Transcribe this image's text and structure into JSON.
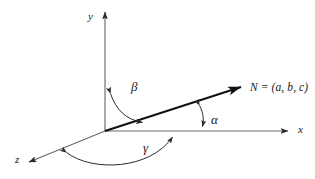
{
  "figure": {
    "background_color": "#ffffff",
    "axis_color": "#6b6b6b",
    "vector_color": "#111111",
    "arc_color": "#2b2b2b",
    "label_color": "#1a1a1a"
  },
  "axes": [
    {
      "name": "y-axis",
      "label": "y",
      "label_x": 88,
      "label_y": 13,
      "direction": "up"
    },
    {
      "name": "x-axis",
      "label": "x",
      "label_x": 298,
      "label_y": 124,
      "direction": "right"
    },
    {
      "name": "z-axis",
      "label": "z",
      "label_x": 15,
      "label_y": 154,
      "direction": "lower-left"
    }
  ],
  "vector": {
    "name": "N",
    "label": "N = (a, b, c)",
    "label_x": 250,
    "label_y": 82,
    "components": [
      "a",
      "b",
      "c"
    ],
    "origin": {
      "x": 105,
      "y": 131
    },
    "tip": {
      "x": 245,
      "y": 86
    }
  },
  "angles": [
    {
      "name": "alpha",
      "label": "α",
      "label_x": 211,
      "label_y": 113,
      "between": [
        "x-axis",
        "N"
      ],
      "arrowheads": "both"
    },
    {
      "name": "beta",
      "label": "β",
      "label_x": 131,
      "label_y": 80,
      "between": [
        "y-axis",
        "N"
      ],
      "arrowheads": "both"
    },
    {
      "name": "gamma",
      "label": "γ",
      "label_x": 143,
      "label_y": 141,
      "between": [
        "z-axis",
        "x-axis"
      ],
      "arrowheads": "both"
    }
  ]
}
